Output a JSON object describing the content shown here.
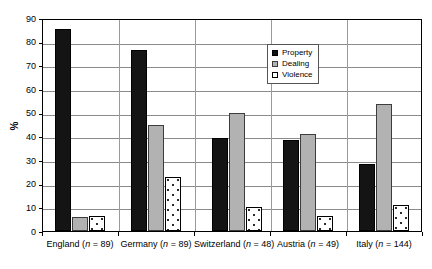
{
  "chart_data": {
    "type": "bar",
    "title": "",
    "subtitle": "",
    "xlabel": "",
    "ylabel": "%",
    "ylim": [
      0,
      90
    ],
    "ytick_step": 10,
    "yticks": [
      0,
      10,
      20,
      30,
      40,
      50,
      60,
      70,
      80,
      90
    ],
    "ytick_labels": [
      "0",
      "10",
      "20",
      "30",
      "40",
      "50",
      "60",
      "70",
      "80",
      "90"
    ],
    "grid": true,
    "grid_axis": "y",
    "legend_position": "upper-center-right",
    "categories": [
      "England (n = 89)",
      "Germany (n = 89)",
      "Switzerland (n = 48)",
      "Austria (n = 49)",
      "Italy (n = 144)"
    ],
    "category_names": [
      "England",
      "Germany",
      "Switzerland",
      "Austria",
      "Italy"
    ],
    "category_n": [
      89,
      89,
      48,
      49,
      144
    ],
    "series": [
      {
        "name": "Property",
        "color": "#141414",
        "pattern": "solid-black",
        "values": [
          85.5,
          76.5,
          39.5,
          38.5,
          28.5
        ]
      },
      {
        "name": "Dealing",
        "color": "#b2b2b2",
        "pattern": "solid-gray",
        "values": [
          6.0,
          45.0,
          50.0,
          41.0,
          53.5
        ]
      },
      {
        "name": "Violence",
        "color": "#ffffff",
        "pattern": "dotted-white",
        "values": [
          6.5,
          23.0,
          10.0,
          6.5,
          11.0
        ]
      }
    ]
  },
  "legend": {
    "items": [
      {
        "label": "Property"
      },
      {
        "label": "Dealing"
      },
      {
        "label": "Violence"
      }
    ]
  },
  "axis": {
    "y_title": "%"
  }
}
